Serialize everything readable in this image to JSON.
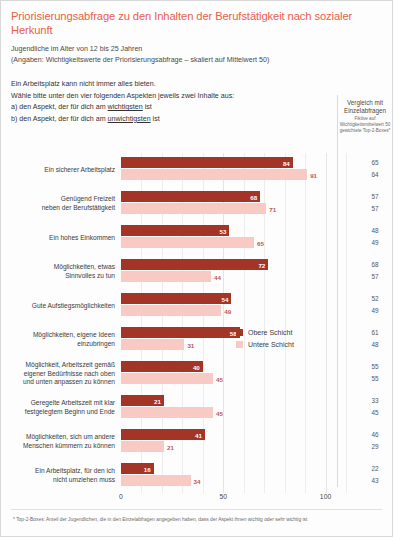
{
  "header": {
    "title": "Priorisierungsabfrage zu den Inhalten der Berufstätigkeit nach sozialer Herkunft",
    "subtitle_1": "Jugendliche im Alter von 12 bis 25 Jahren",
    "subtitle_2": "(Angaben: Wichtigkeitswerte der Priorisierungsabfrage – skaliert auf Mittelwert 50)",
    "intro_1": "Ein Arbeitsplatz kann nicht immer alles bieten.",
    "intro_2": "Wähle bitte unter den vier folgenden Aspekten jeweils zwei Inhalte aus:",
    "intro_3_pre": "a) den Aspekt, der für dich am ",
    "intro_3_underline": "wichtigsten",
    "intro_3_post": " ist",
    "intro_4_pre": "b) den Aspekt, der für dich am ",
    "intro_4_underline": "unwichtigsten",
    "intro_4_post": " ist"
  },
  "comparison_header": {
    "line_1": "Vergleich mit",
    "line_2": "Einzelabfragen",
    "note": "Fiktive auf Wichtigkeitsmittelwert 50 gewichtete Top-2-Boxes*"
  },
  "legend": {
    "items": [
      {
        "label": "Obere Schicht",
        "color": "#a33526",
        "key": "upper"
      },
      {
        "label": "Untere Schicht",
        "color": "#f8cac3",
        "key": "lower"
      }
    ]
  },
  "footnote": "* Top-2-Boxes: Anteil der Jugendlichen, die in den Einzelabfragen angegeben haben, dass der Aspekt ihnen wichtig oder sehr wichtig ist",
  "chart_data": {
    "type": "bar",
    "orientation": "horizontal",
    "title": "Priorisierungsabfrage zu den Inhalten der Berufstätigkeit nach sozialer Herkunft",
    "subtitle": "Jugendliche im Alter von 12 bis 25 Jahren",
    "xlabel": "",
    "ylabel": "",
    "xlim": [
      0,
      110
    ],
    "xticks": [
      0,
      50,
      100
    ],
    "xtick_labels": [
      "0",
      "50",
      "100"
    ],
    "grid": true,
    "legend_position": "middle-right",
    "categories": [
      "Ein sicherer Arbeitsplatz",
      "Genügend Freizeit neben der Berufstätigkeit",
      "Ein hohes Einkommen",
      "Möglichkeiten, etwas Sinnvolles zu tun",
      "Gute Aufstiegsmöglichkeiten",
      "Möglichkeiten, eigene Ideen einzubringen",
      "Möglichkeit, Arbeitszeit gemäß eigener Bedürfnisse nach oben und unten anpassen zu können",
      "Geregelte Arbeitszeit mit klar festgelegtem Beginn und Ende",
      "Möglichkeiten, sich um andere Menschen kümmern zu können",
      "Ein Arbeitsplatz, für den ich nicht umziehen muss"
    ],
    "category_lines": [
      [
        "Ein sicherer Arbeitsplatz"
      ],
      [
        "Genügend Freizeit",
        "neben der Berufstätigkeit"
      ],
      [
        "Ein hohes Einkommen"
      ],
      [
        "Möglichkeiten, etwas",
        "Sinnvolles zu tun"
      ],
      [
        "Gute Aufstiegsmöglichkeiten"
      ],
      [
        "Möglichkeiten, eigene Ideen",
        "einzubringen"
      ],
      [
        "Möglichkeit, Arbeitszeit gemäß",
        "eigener Bedürfnisse nach oben",
        "und unten anpassen zu können"
      ],
      [
        "Geregelte Arbeitszeit mit klar",
        "festgelegtem Beginn und Ende"
      ],
      [
        "Möglichkeiten, sich um andere",
        "Menschen kümmern zu können"
      ],
      [
        "Ein Arbeitsplatz, für den ich",
        "nicht umziehen muss"
      ]
    ],
    "series": [
      {
        "name": "Obere Schicht",
        "color": "#a33526",
        "values": [
          84,
          68,
          53,
          72,
          54,
          58,
          40,
          21,
          41,
          16
        ]
      },
      {
        "name": "Untere Schicht",
        "color": "#f8cac3",
        "values": [
          91,
          71,
          65,
          44,
          49,
          31,
          45,
          45,
          21,
          34
        ]
      }
    ],
    "comparison_column": {
      "header": "Vergleich mit Einzelabfragen",
      "series": [
        {
          "name": "Obere Schicht",
          "values": [
            65,
            57,
            48,
            68,
            52,
            61,
            55,
            33,
            46,
            22
          ]
        },
        {
          "name": "Untere Schicht",
          "values": [
            64,
            57,
            49,
            57,
            49,
            48,
            55,
            45,
            29,
            43
          ]
        }
      ]
    }
  }
}
